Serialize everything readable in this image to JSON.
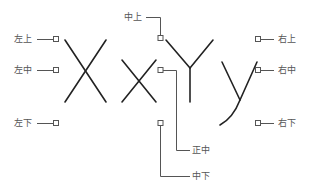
{
  "diagram": {
    "type": "text-alignment-positions",
    "sample_glyphs": [
      "X",
      "x",
      "Y",
      "y"
    ],
    "labels": {
      "top_left": "左上",
      "middle_left": "左中",
      "bottom_left": "左下",
      "top_center": "中上",
      "center": "正中",
      "bottom_center": "中下",
      "top_right": "右上",
      "middle_right": "右中",
      "bottom_right": "右下"
    },
    "colors": {
      "glyph_stroke": "#222222",
      "leader_line": "#555555",
      "label_text": "#555555",
      "background": "#ffffff"
    }
  }
}
